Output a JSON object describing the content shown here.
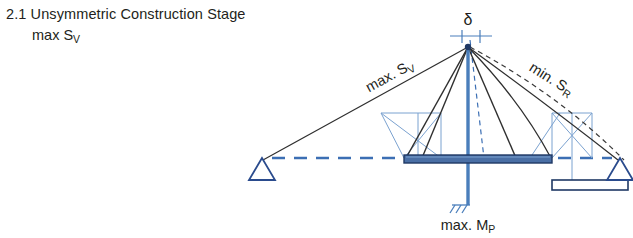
{
  "figure": {
    "heading_number": "2.1",
    "heading_text": "Unsymmetric Construction Stage",
    "heading_full": "2.1 Unsymmetric Construction Stage",
    "subheading_prefix": "max S",
    "subheading_subscript": "V",
    "subheading_full": "max Sᴠ"
  },
  "labels": {
    "deflection_symbol": "δ",
    "left_cable_prefix": "max. S",
    "left_cable_subscript": "V",
    "left_cable_full": "max. Sᴠ",
    "right_cable_prefix": "min. S",
    "right_cable_subscript": "R",
    "right_cable_full": "min. Sʀ",
    "pylon_moment_prefix": "max. M",
    "pylon_moment_subscript": "P",
    "pylon_moment_full": "max. Mᴘ"
  },
  "colors": {
    "deck_fill": "#4a6fa5",
    "deck_stroke": "#1f3864",
    "pylon": "#4a7ebb",
    "cable_dark": "#2f2f2f",
    "light_blue": "#7ba2d0",
    "dashed_blue": "#3c6fb4",
    "support_stroke": "#2a4b8d",
    "text": "#231f20",
    "background": "#ffffff"
  },
  "geometry": {
    "pylon_apex": {
      "x": 468,
      "y": 46
    },
    "pylon_base": {
      "x": 468,
      "y": 205
    },
    "deck_left_x": 404,
    "deck_right_x": 552,
    "deck_y": 158,
    "left_support": {
      "x": 262,
      "y": 160
    },
    "right_support": {
      "x": 620,
      "y": 160
    },
    "reference_line_y": 158,
    "delta_dimension_y": 30
  },
  "elements": {
    "left_support_name": "pin support (triangle)",
    "right_support_name": "pin support (triangle)",
    "pylon_base_name": "fixed base with hatching",
    "form_traveller_left": "travelling formwork carriage (left)",
    "form_traveller_right": "travelling formwork carriage (right)",
    "segment_box": "precast segment (hollow rectangle)",
    "deck_name": "bridge deck girder",
    "backstay_cable": "backstay cable",
    "stay_cables": "stay cables",
    "deflected_shape": "dashed deflected cable shape"
  }
}
